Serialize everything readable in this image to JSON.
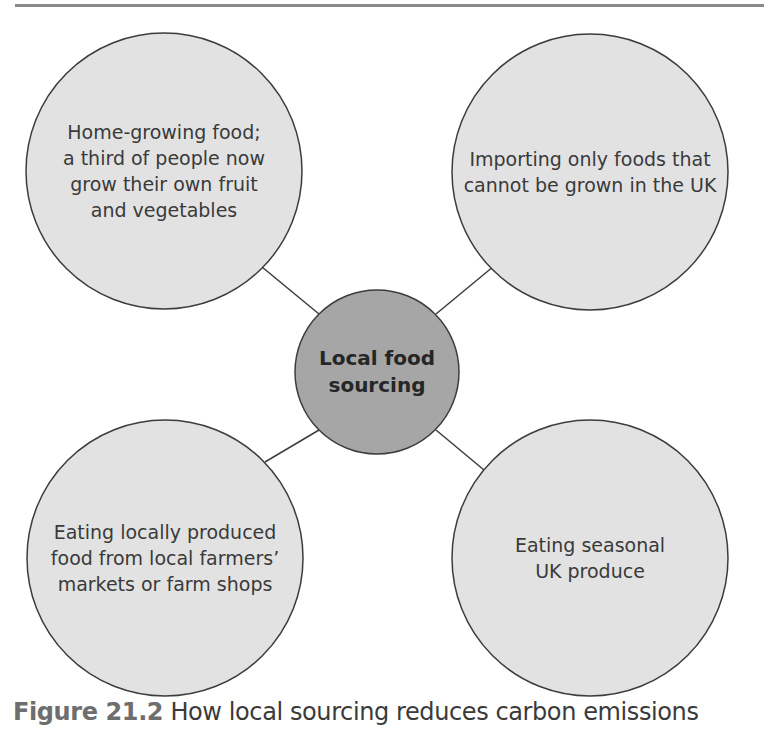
{
  "diagram": {
    "type": "spider-diagram",
    "center": {
      "label": "Local food\nsourcing",
      "fill": "#a6a6a6"
    },
    "outer_fill": "#e2e2e2",
    "stroke": "#3c3c3c",
    "nodes": [
      {
        "position": "top-left",
        "label": "Home-growing food;\na third of people now\ngrow their own fruit\nand vegetables"
      },
      {
        "position": "top-right",
        "label": "Importing only foods that\ncannot be grown in the UK"
      },
      {
        "position": "bottom-left",
        "label": "Eating locally produced\nfood from local farmers’\nmarkets or farm shops"
      },
      {
        "position": "bottom-right",
        "label": "Eating seasonal\nUK produce"
      }
    ]
  },
  "caption": {
    "figure_number": "Figure 21.2",
    "text": "How local sourcing reduces carbon emissions"
  }
}
